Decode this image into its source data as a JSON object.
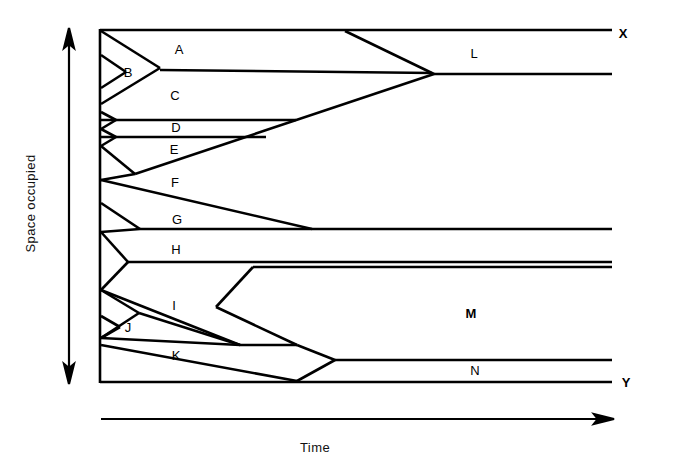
{
  "figure": {
    "type": "cladogram-style range chart",
    "axes": {
      "y": {
        "label": "Space occupied",
        "arrow": "double-headed-vertical"
      },
      "x": {
        "label": "Time",
        "arrow": "right"
      }
    },
    "endpoints": [
      {
        "id": "X",
        "label": "X",
        "x": 623,
        "y": 33
      },
      {
        "id": "Y",
        "label": "Y",
        "x": 626,
        "y": 382
      }
    ],
    "regions": [
      {
        "id": "A",
        "label": "A",
        "x": 179,
        "y": 49,
        "bold": false
      },
      {
        "id": "B",
        "label": "B",
        "x": 128,
        "y": 72,
        "bold": false
      },
      {
        "id": "C",
        "label": "C",
        "x": 175,
        "y": 95,
        "bold": false
      },
      {
        "id": "D",
        "label": "D",
        "x": 176,
        "y": 127,
        "bold": false
      },
      {
        "id": "E",
        "label": "E",
        "x": 174,
        "y": 149,
        "bold": false
      },
      {
        "id": "F",
        "label": "F",
        "x": 175,
        "y": 182,
        "bold": false
      },
      {
        "id": "G",
        "label": "G",
        "x": 177,
        "y": 219,
        "bold": false
      },
      {
        "id": "H",
        "label": "H",
        "x": 176,
        "y": 249,
        "bold": false
      },
      {
        "id": "I",
        "label": "I",
        "x": 174,
        "y": 305,
        "bold": false
      },
      {
        "id": "J",
        "label": "J",
        "x": 128,
        "y": 327,
        "bold": false
      },
      {
        "id": "K",
        "label": "K",
        "x": 176,
        "y": 355,
        "bold": false
      },
      {
        "id": "L",
        "label": "L",
        "x": 474,
        "y": 53,
        "bold": false
      },
      {
        "id": "M",
        "label": "M",
        "x": 471,
        "y": 313,
        "bold": true
      },
      {
        "id": "N",
        "label": "N",
        "x": 475,
        "y": 370,
        "bold": false
      }
    ],
    "frame": {
      "left": 99,
      "top": 29,
      "right": 612,
      "bottom": 383
    },
    "colors": {
      "line": "#000000",
      "background": "#ffffff"
    }
  }
}
